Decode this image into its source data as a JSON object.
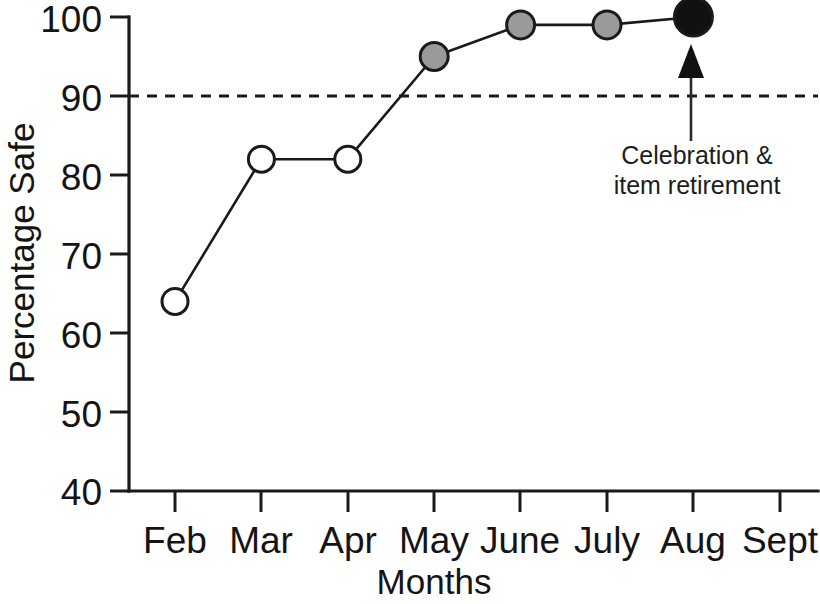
{
  "chart_data": {
    "type": "line",
    "title": "",
    "xlabel": "Months",
    "ylabel": "Percentage Safe",
    "categories": [
      "Feb",
      "Mar",
      "Apr",
      "May",
      "June",
      "July",
      "Aug",
      "Sept"
    ],
    "values": [
      64,
      82,
      82,
      95,
      99,
      99,
      100,
      null
    ],
    "series": [
      {
        "name": "Percentage Safe",
        "values": [
          64,
          82,
          82,
          95,
          99,
          99,
          100,
          null
        ]
      }
    ],
    "points": [
      {
        "category": "Feb",
        "value": 64,
        "marker": "open-circle",
        "fill": "#ffffff",
        "radius": 13
      },
      {
        "category": "Mar",
        "value": 82,
        "marker": "open-circle",
        "fill": "#ffffff",
        "radius": 13
      },
      {
        "category": "Apr",
        "value": 82,
        "marker": "open-circle",
        "fill": "#ffffff",
        "radius": 13
      },
      {
        "category": "May",
        "value": 95,
        "marker": "filled-circle",
        "fill": "#9a9a9a",
        "radius": 14
      },
      {
        "category": "June",
        "value": 99,
        "marker": "filled-circle",
        "fill": "#9a9a9a",
        "radius": 14
      },
      {
        "category": "July",
        "value": 99,
        "marker": "filled-circle",
        "fill": "#9a9a9a",
        "radius": 14
      },
      {
        "category": "Aug",
        "value": 100,
        "marker": "filled-circle",
        "fill": "#111111",
        "radius": 19
      },
      {
        "category": "Sept",
        "value": null,
        "marker": "none",
        "fill": "none",
        "radius": 0
      }
    ],
    "yticks": [
      40,
      50,
      60,
      70,
      80,
      90,
      100
    ],
    "ytick_labels": [
      "40",
      "50",
      "60",
      "70",
      "80",
      "90",
      "100"
    ],
    "ylim": [
      40,
      100
    ],
    "grid": false,
    "legend": null,
    "threshold": {
      "value": 90,
      "style": "dashed",
      "label": ""
    },
    "annotations": [
      {
        "text_line1": "Celebration &",
        "text_line2": "item retirement",
        "points_to_category": "Aug",
        "arrow": "up-arrow"
      }
    ],
    "colors": {
      "axis": "#1a1a1a",
      "line": "#1a1a1a",
      "open_marker_fill": "#ffffff",
      "gray_marker_fill": "#9a9a9a",
      "black_marker_fill": "#111111",
      "background": "#ffffff"
    }
  },
  "axis": {
    "y_title": "Percentage Safe",
    "x_title": "Months",
    "y_labels": [
      "100",
      "90",
      "80",
      "70",
      "60",
      "50",
      "40"
    ],
    "x_labels": [
      "Feb",
      "Mar",
      "Apr",
      "May",
      "June",
      "July",
      "Aug",
      "Sept"
    ]
  },
  "annotation": {
    "line1": "Celebration &",
    "line2": "item retirement"
  }
}
